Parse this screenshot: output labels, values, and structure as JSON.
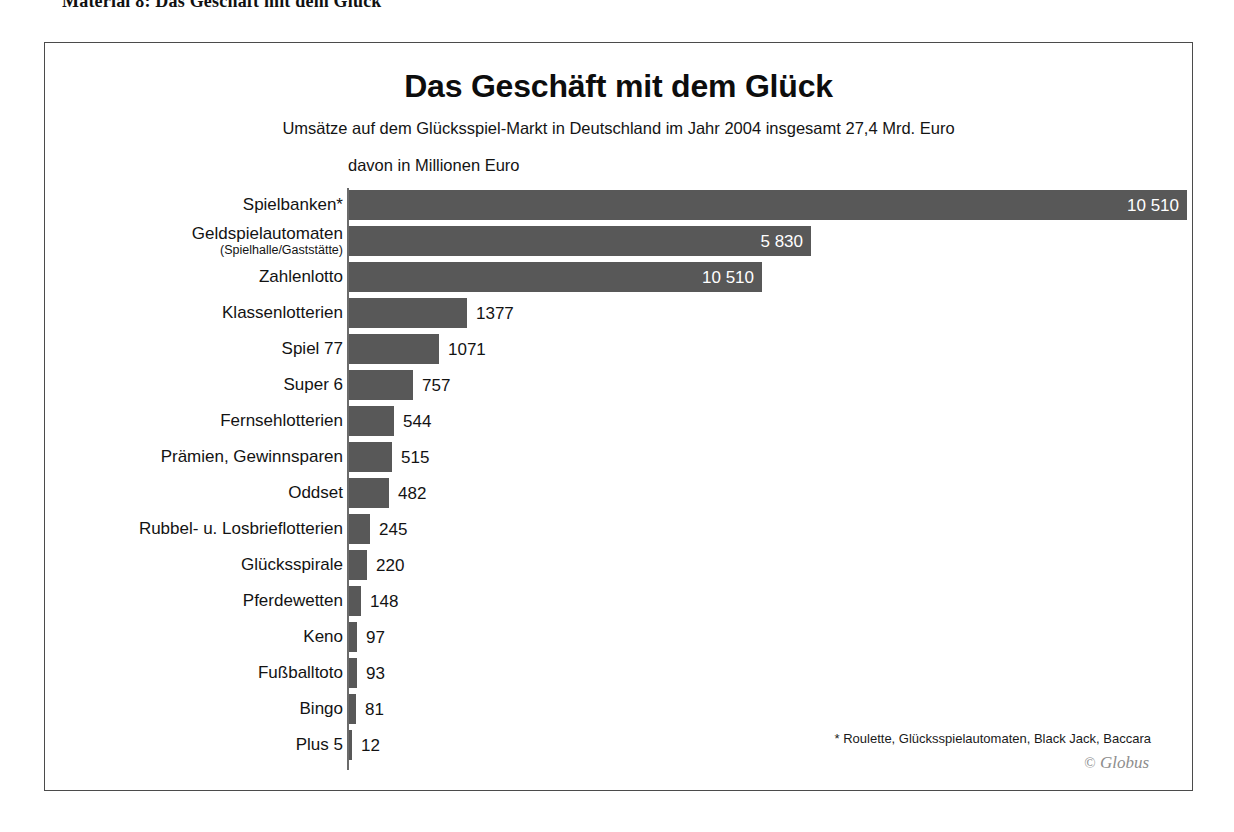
{
  "page": {
    "header": "Material 8: Das Geschäft mit dem Glück"
  },
  "figure": {
    "title": "Das Geschäft mit dem Glück",
    "subtitle": "Umsätze auf dem Glücksspiel-Markt in Deutschland im Jahr 2004 insgesamt 27,4 Mrd. Euro",
    "unit_label": "davon in Millionen Euro",
    "footnote": "* Roulette, Glücksspielautomaten, Black Jack, Baccara",
    "copyright_mark": "©",
    "copyright_text": "Globus",
    "bar_color": "#585858",
    "frame_color": "#4b4b4b"
  },
  "chart_data": {
    "type": "bar",
    "orientation": "horizontal",
    "title": "Das Geschäft mit dem Glück",
    "subtitle": "Umsätze auf dem Glücksspiel-Markt in Deutschland im Jahr 2004 insgesamt 27,4 Mrd. Euro",
    "xlabel": "davon in Millionen Euro",
    "ylabel": "",
    "unit": "Millionen Euro",
    "year": 2004,
    "total": "27,4 Mrd. Euro",
    "grid": false,
    "legend": false,
    "xlim": [
      0,
      10510
    ],
    "categories": [
      "Spielbanken*",
      "Geldspielautomaten",
      "Zahlenlotto",
      "Klassenlotterien",
      "Spiel 77",
      "Super 6",
      "Fernsehlotterien",
      "Prämien, Gewinnsparen",
      "Oddset",
      "Rubbel- u. Losbrieflotterien",
      "Glücksspirale",
      "Pferdewetten",
      "Keno",
      "Fußballtoto",
      "Bingo",
      "Plus 5"
    ],
    "values": [
      10510,
      5830,
      5200,
      1377,
      1071,
      757,
      544,
      515,
      482,
      245,
      220,
      148,
      97,
      93,
      81,
      12
    ],
    "value_labels": [
      "10 510",
      "5 830",
      "10 510",
      "1377",
      "1071",
      "757",
      "544",
      "515",
      "482",
      "245",
      "220",
      "148",
      "97",
      "93",
      "81",
      "12"
    ],
    "rows": [
      {
        "label": "Spielbanken*",
        "sublabel": "",
        "value": 10510,
        "value_label": "10 510",
        "bar_px": 838,
        "label_inside": true
      },
      {
        "label": "Geldspielautomaten",
        "sublabel": "(Spielhalle/Gaststätte)",
        "value": 5830,
        "value_label": "5 830",
        "bar_px": 462,
        "label_inside": true
      },
      {
        "label": "Zahlenlotto",
        "sublabel": "",
        "value": 5200,
        "value_label": "10 510",
        "bar_px": 413,
        "label_inside": true
      },
      {
        "label": "Klassenlotterien",
        "sublabel": "",
        "value": 1377,
        "value_label": "1377",
        "bar_px": 118,
        "label_inside": false
      },
      {
        "label": "Spiel 77",
        "sublabel": "",
        "value": 1071,
        "value_label": "1071",
        "bar_px": 90,
        "label_inside": false
      },
      {
        "label": "Super 6",
        "sublabel": "",
        "value": 757,
        "value_label": "757",
        "bar_px": 64,
        "label_inside": false
      },
      {
        "label": "Fernsehlotterien",
        "sublabel": "",
        "value": 544,
        "value_label": "544",
        "bar_px": 45,
        "label_inside": false
      },
      {
        "label": "Prämien, Gewinnsparen",
        "sublabel": "",
        "value": 515,
        "value_label": "515",
        "bar_px": 43,
        "label_inside": false
      },
      {
        "label": "Oddset",
        "sublabel": "",
        "value": 482,
        "value_label": "482",
        "bar_px": 40,
        "label_inside": false
      },
      {
        "label": "Rubbel- u. Losbrieflotterien",
        "sublabel": "",
        "value": 245,
        "value_label": "245",
        "bar_px": 21,
        "label_inside": false
      },
      {
        "label": "Glücksspirale",
        "sublabel": "",
        "value": 220,
        "value_label": "220",
        "bar_px": 18,
        "label_inside": false
      },
      {
        "label": "Pferdewetten",
        "sublabel": "",
        "value": 148,
        "value_label": "148",
        "bar_px": 12,
        "label_inside": false
      },
      {
        "label": "Keno",
        "sublabel": "",
        "value": 97,
        "value_label": "97",
        "bar_px": 8,
        "label_inside": false
      },
      {
        "label": "Fußballtoto",
        "sublabel": "",
        "value": 93,
        "value_label": "93",
        "bar_px": 8,
        "label_inside": false
      },
      {
        "label": "Bingo",
        "sublabel": "",
        "value": 81,
        "value_label": "81",
        "bar_px": 7,
        "label_inside": false
      },
      {
        "label": "Plus 5",
        "sublabel": "",
        "value": 12,
        "value_label": "12",
        "bar_px": 3,
        "label_inside": false
      }
    ],
    "annotations": [
      "* Roulette, Glücksspielautomaten, Black Jack, Baccara",
      "© Globus"
    ]
  }
}
